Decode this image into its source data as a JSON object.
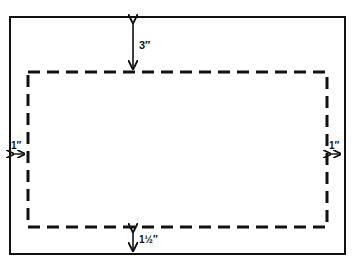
{
  "diagram": {
    "margins": {
      "top": "3″",
      "left": "1″",
      "right": "1″",
      "bottom": "1½″"
    },
    "colors": {
      "line": "#111111",
      "background": "#ffffff"
    }
  }
}
